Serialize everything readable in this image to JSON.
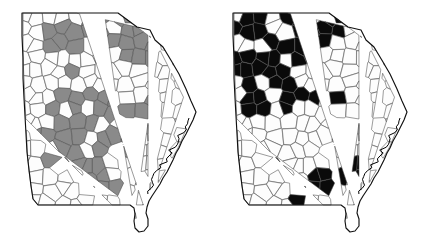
{
  "figure": {
    "type": "two-panel-choropleth",
    "panel_count": 2,
    "background_color": "#ffffff"
  },
  "chart_data": {
    "type": "map",
    "title": "",
    "xlabel": "",
    "ylabel": "",
    "legend_position": "none",
    "grid": false,
    "panels": [
      {
        "id": "left",
        "name": "left-map",
        "fill_color": "#8a8a8a",
        "unfilled_color": "#fdfdfd",
        "border_color": "#4a4a4a",
        "highlighted_count": 58,
        "total_units": 159,
        "pattern_description": "Shaded counties form a broad band across north-central and central Georgia, with scattered shading in the northeast and a few isolated counties in the southwest.",
        "highlighted_regions": [
          "north-central cluster",
          "northeast border cluster",
          "central Georgia band",
          "east-central cluster",
          "southwest isolated counties"
        ]
      },
      {
        "id": "right",
        "name": "right-map",
        "fill_color": "#0a0a0a",
        "unfilled_color": "#fdfdfd",
        "border_color": "#4a4a4a",
        "highlighted_count": 46,
        "total_units": 159,
        "pattern_description": "Filled counties concentrate densely in the northwest quadrant and along the north-central tier, with a secondary cluster in the south-central region and two counties on the southeast coast.",
        "highlighted_regions": [
          "northwest dense cluster",
          "north-central tier",
          "south-central cluster",
          "southeast coastal counties"
        ]
      }
    ],
    "categories": [
      "unshaded",
      "shaded"
    ],
    "series": [
      {
        "name": "left panel",
        "values": [
          101,
          58
        ]
      },
      {
        "name": "right panel",
        "values": [
          113,
          46
        ]
      }
    ]
  },
  "colors": {
    "gray_fill": "#8a8a8a",
    "black_fill": "#0a0a0a",
    "empty_fill": "#fdfdfd",
    "county_border": "#4a4a4a",
    "state_border": "#111111",
    "page_background": "#ffffff"
  }
}
